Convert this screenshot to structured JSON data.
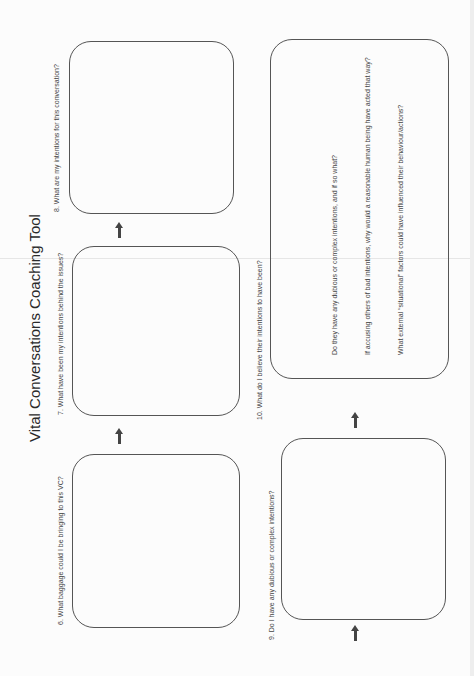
{
  "document": {
    "title": "Vital Conversations Coaching Tool",
    "orientation": "rotated-90-ccw",
    "questions": {
      "q6": "6. What baggage could I be bringing to this VC?",
      "q7": "7. What have been my intentions behind the issues?",
      "q8": "8. What are my intentions for this conversation?",
      "q9": "9. Do I have any dubious or complex intentions?",
      "q10": "10. What do I believe their intentions to have been?"
    },
    "q10_prompts": [
      "Do they have any dubious or complex intentions, and if so what?",
      "If accusing others of bad intentions, why would a reasonable human being have acted that way?",
      "What external “situational” factors could have influenced their behaviour/actions?"
    ],
    "colors": {
      "paper": "#fcfcfc",
      "ink": "#444444",
      "box_border": "#555555"
    }
  }
}
